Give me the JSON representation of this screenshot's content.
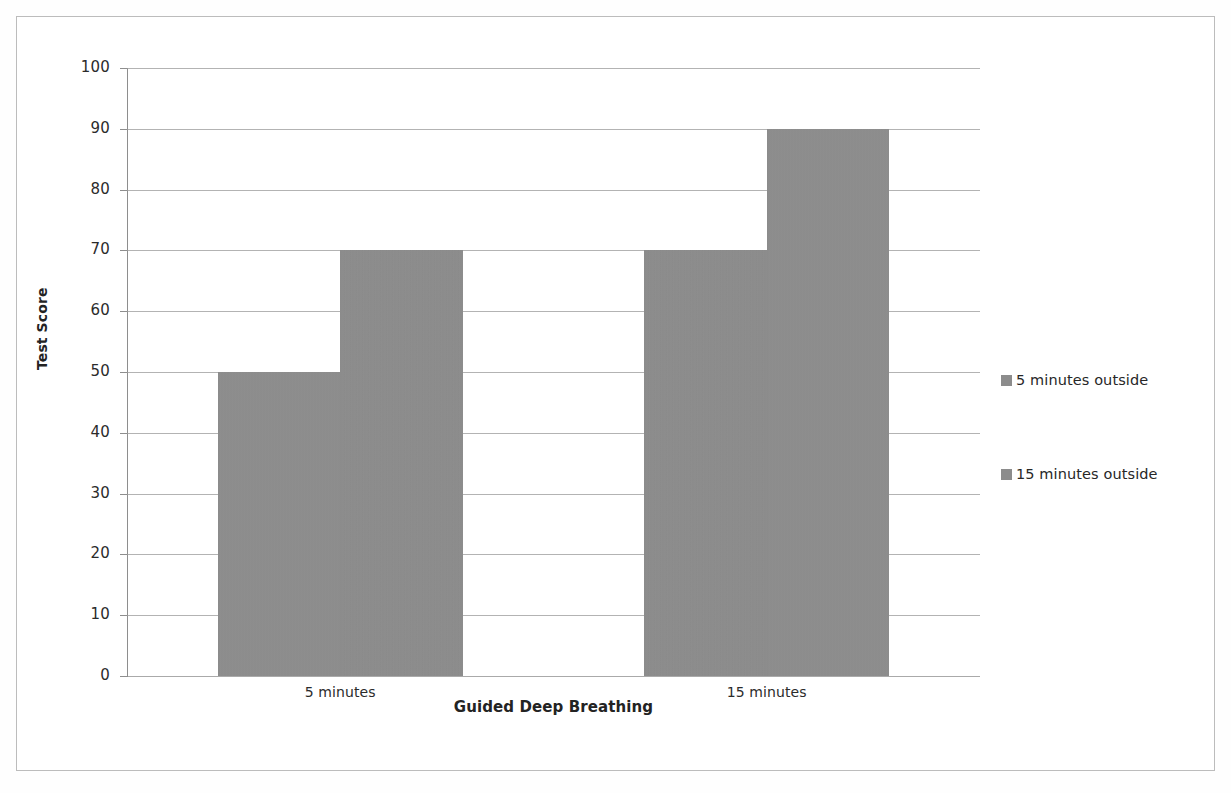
{
  "chart_data": {
    "type": "bar",
    "title": "",
    "xlabel": "Guided Deep Breathing",
    "ylabel": "Test Score",
    "categories": [
      "5 minutes",
      "15 minutes"
    ],
    "series": [
      {
        "name": "5 minutes outside",
        "values": [
          50,
          70
        ],
        "color": "#8c8c8c"
      },
      {
        "name": "15 minutes outside",
        "values": [
          70,
          90
        ],
        "color": "#8c8c8c"
      }
    ],
    "ylim": [
      0,
      100
    ],
    "ytick_step": 10,
    "yticks": [
      100,
      90,
      80,
      70,
      60,
      50,
      40,
      30,
      20,
      10,
      0
    ],
    "grid": true,
    "legend_position": "right"
  },
  "axes": {
    "y_title": "Test Score",
    "x_title": "Guided Deep Breathing"
  },
  "legend": {
    "items": [
      {
        "label": "5 minutes outside"
      },
      {
        "label": "15 minutes outside"
      }
    ]
  },
  "colors": {
    "bar_fill": "#8c8c8c",
    "gridline": "#9a9a9a",
    "axis_line": "#8e8e8e",
    "frame": "#bcbcbc",
    "text": "#2b2b2b"
  }
}
